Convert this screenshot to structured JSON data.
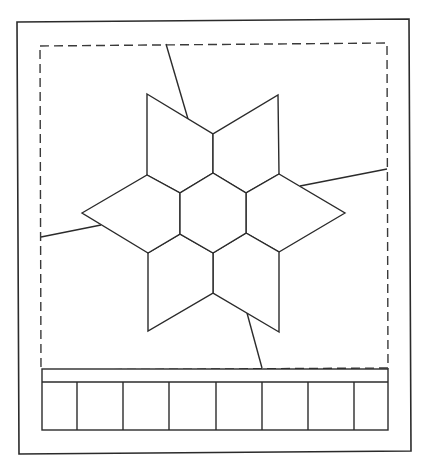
{
  "diagram": {
    "colors": {
      "stroke": "#2b2b2b",
      "dashed": "#3a3a3a",
      "background": "#ffffff"
    },
    "outer_frame": {
      "points": "17,22 409,19 411,451 19,454"
    },
    "dashed_border": {
      "points": "40,46 387,43 388,368 41,370"
    },
    "hexagon": {
      "points": "213,173 246,193 246,233 213,253 180,234 180,193"
    },
    "rhombi": [
      {
        "name": "top-left",
        "points": "147,94 213,134 213,173 180,193 147,175"
      },
      {
        "name": "top-right",
        "points": "278,95 279,174 246,193 213,173 213,134"
      },
      {
        "name": "right",
        "points": "345,213 279,252 246,233 246,193 279,174"
      },
      {
        "name": "bottom-right",
        "points": "279,332 213,293 213,253 246,233 279,252"
      },
      {
        "name": "bottom-left",
        "points": "148,331 148,253 180,234 213,253 213,293"
      },
      {
        "name": "left",
        "points": "82,213 147,175 180,193 180,234 148,253"
      }
    ],
    "connector_lines": [
      {
        "name": "top",
        "x1": 166,
        "y1": 44,
        "x2": 188,
        "y2": 119
      },
      {
        "name": "right",
        "x1": 300,
        "y1": 186,
        "x2": 387,
        "y2": 169
      },
      {
        "name": "left",
        "x1": 41,
        "y1": 237,
        "x2": 101,
        "y2": 225
      },
      {
        "name": "bottom",
        "x1": 247,
        "y1": 313,
        "x2": 262,
        "y2": 368
      }
    ],
    "bottom_strip": {
      "band": {
        "x1": 42,
        "x2": 388,
        "y_top": 369,
        "y_mid": 382,
        "y_bottom": 430
      },
      "dividers": [
        77,
        123,
        169,
        216,
        262,
        308,
        354
      ],
      "cell_count": 8
    }
  }
}
